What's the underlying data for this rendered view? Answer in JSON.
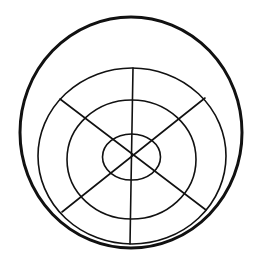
{
  "diagram": {
    "title": "",
    "width": 259,
    "height": 264,
    "background": "#ffffff",
    "stroke_color": "#111111",
    "outer_circle": {
      "cx": 131,
      "cy": 132.5,
      "rx": 111,
      "ry": 115.5,
      "stroke_width": 3
    },
    "rings": [
      {
        "name": "ring-2",
        "cx": 132,
        "cy": 156,
        "rx": 94,
        "ry": 88,
        "stroke_width": 1.6
      },
      {
        "name": "ring-3",
        "cx": 131.5,
        "cy": 159.5,
        "rx": 64.5,
        "ry": 59.5,
        "stroke_width": 1.6
      },
      {
        "name": "ring-inner",
        "cx": 131.5,
        "cy": 157,
        "rx": 29,
        "ry": 23,
        "stroke_width": 1.6
      }
    ],
    "spokes": [
      {
        "name": "spoke-vertical",
        "x1": 133,
        "y1": 68,
        "x2": 130,
        "y2": 244,
        "stroke_width": 1.6
      },
      {
        "name": "spoke-diagonal-tl-br",
        "x1": 60,
        "y1": 99,
        "x2": 206,
        "y2": 210,
        "stroke_width": 1.6
      },
      {
        "name": "spoke-diagonal-tr-bl",
        "x1": 205,
        "y1": 98,
        "x2": 62,
        "y2": 212,
        "stroke_width": 1.6
      }
    ]
  }
}
